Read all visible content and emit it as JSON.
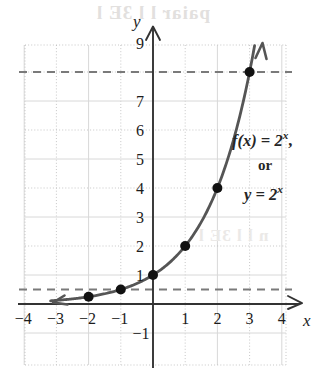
{
  "figure": {
    "title_visible": false,
    "axis_labels": {
      "x": "x",
      "y": "y"
    },
    "annotations": {
      "function_line1_prefix": "f(x) = 2",
      "function_line1_exponent": "x",
      "function_line1_suffix": ",",
      "connector": "or",
      "function_line3_prefix": "y = 2",
      "function_line3_exponent": "x"
    },
    "bleed_through": {
      "top": "paiar l l 3E l",
      "middle": "n l l 3E l"
    }
  },
  "chart_data": {
    "type": "line",
    "title": "",
    "xlabel": "x",
    "ylabel": "y",
    "function": "f(x) = 2^x",
    "alt_function": "y = 2^x",
    "xlim": [
      -4.6,
      4.6
    ],
    "ylim": [
      -1.6,
      10.2
    ],
    "grid": true,
    "grid_style": "dotted-unit-with-solid-every-2",
    "x_tick_labels": [
      "-4",
      "-3",
      "-2",
      "-1",
      "1",
      "2",
      "3",
      "4"
    ],
    "x_tick_values": [
      -4,
      -3,
      -2,
      -1,
      1,
      2,
      3,
      4
    ],
    "y_tick_labels": [
      "9",
      "7",
      "6",
      "5",
      "4",
      "3",
      "2",
      "1",
      "-1"
    ],
    "y_tick_values": [
      9,
      7,
      6,
      5,
      4,
      3,
      2,
      1,
      -1
    ],
    "y_tick_omitted": [
      8
    ],
    "x": [
      -2,
      -1,
      0,
      1,
      2,
      3
    ],
    "values": [
      0.25,
      0.5,
      1,
      2,
      4,
      8
    ],
    "points": [
      {
        "x": -2,
        "y": 0.25
      },
      {
        "x": -1,
        "y": 0.5
      },
      {
        "x": 0,
        "y": 1
      },
      {
        "x": 1,
        "y": 2
      },
      {
        "x": 2,
        "y": 4
      },
      {
        "x": 3,
        "y": 8
      }
    ],
    "curve_arrows": [
      "left-lower-end",
      "right-upper-end"
    ],
    "reference_lines": [
      {
        "orientation": "horizontal",
        "y": 8,
        "style": "dashed"
      },
      {
        "orientation": "horizontal",
        "y": 0.5,
        "style": "dashed"
      }
    ],
    "colors": {
      "curve": "#555555",
      "point": "#111111",
      "axis": "#333333",
      "grid_dotted": "#b9b9b9",
      "grid_solid": "#d8d8d8",
      "dashed_reference": "#7a7a7a",
      "text": "#1c1c1c",
      "background": "#ffffff"
    }
  }
}
